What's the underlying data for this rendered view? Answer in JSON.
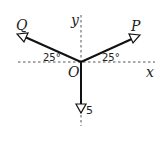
{
  "diagram": {
    "type": "force-diagram",
    "origin_label": "O",
    "axes": {
      "x_label": "x",
      "y_label": "y",
      "style": "dashed"
    },
    "forces": [
      {
        "name": "P",
        "label": "P",
        "direction": "up-right",
        "angle_from_x_axis_deg": 25,
        "angle_label": "25°"
      },
      {
        "name": "Q",
        "label": "Q",
        "direction": "up-left",
        "angle_from_x_axis_deg": 25,
        "angle_label": "25°"
      },
      {
        "name": "weight",
        "label": "5",
        "direction": "down",
        "magnitude": 5
      }
    ],
    "colors": {
      "line": "#111111",
      "axis": "#555555",
      "background": "#ffffff"
    }
  }
}
